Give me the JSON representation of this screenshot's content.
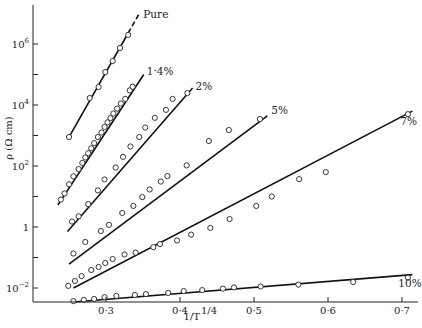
{
  "chart_data": {
    "type": "scatter",
    "title": "",
    "xlabel": "1/T^1/4",
    "xlabel_main": "1/T",
    "xlabel_exp": "1/4",
    "ylabel": "ρ (Ω cm)",
    "yscale": "log",
    "xlim": [
      0.235,
      0.715
    ],
    "ylim_log10": [
      -2.5,
      7.3
    ],
    "grid": false,
    "legend": "inline labels at line ends",
    "x_ticks": [
      {
        "value": 0.3,
        "label": "0·3"
      },
      {
        "value": 0.4,
        "label": "0·4"
      },
      {
        "value": 0.5,
        "label": "0·5"
      },
      {
        "value": 0.6,
        "label": "0·6"
      },
      {
        "value": 0.7,
        "label": "0·7"
      }
    ],
    "y_ticks": [
      {
        "log10": 6,
        "base": "10",
        "exp": "6"
      },
      {
        "log10": 4,
        "base": "10",
        "exp": "4"
      },
      {
        "log10": 2,
        "base": "10",
        "exp": "2"
      },
      {
        "log10": 0,
        "base": "1",
        "exp": ""
      },
      {
        "log10": -2,
        "base": "10",
        "exp": "−2"
      }
    ],
    "y_minor_ticks_log10": [
      5,
      3,
      1,
      -1
    ],
    "series": [
      {
        "name": "Pure",
        "label": "Pure",
        "fit": {
          "x0": 0.25,
          "y0": 2.95,
          "x1": 0.345,
          "y1": 7.0,
          "dashed_from_x": 0.33
        },
        "points": [
          [
            0.25,
            2.95
          ],
          [
            0.278,
            4.23
          ],
          [
            0.29,
            4.59
          ],
          [
            0.299,
            5.08
          ],
          [
            0.309,
            5.44
          ],
          [
            0.319,
            5.87
          ],
          [
            0.33,
            6.3
          ]
        ]
      },
      {
        "name": "1·4%",
        "label": "1·4%",
        "fit": {
          "x0": 0.235,
          "y0": 0.72,
          "x1": 0.351,
          "y1": 5.0
        },
        "points": [
          [
            0.239,
            0.9
          ],
          [
            0.244,
            1.1
          ],
          [
            0.25,
            1.4
          ],
          [
            0.256,
            1.66
          ],
          [
            0.263,
            1.9
          ],
          [
            0.268,
            2.1
          ],
          [
            0.272,
            2.28
          ],
          [
            0.276,
            2.42
          ],
          [
            0.28,
            2.58
          ],
          [
            0.284,
            2.75
          ],
          [
            0.289,
            2.95
          ],
          [
            0.294,
            3.1
          ],
          [
            0.298,
            3.28
          ],
          [
            0.302,
            3.43
          ],
          [
            0.306,
            3.57
          ],
          [
            0.31,
            3.72
          ],
          [
            0.315,
            3.88
          ],
          [
            0.32,
            4.05
          ],
          [
            0.326,
            4.2
          ],
          [
            0.332,
            4.48
          ],
          [
            0.336,
            4.6
          ]
        ]
      },
      {
        "name": "2%",
        "label": "2%",
        "fit": {
          "x0": 0.248,
          "y0": -0.15,
          "x1": 0.417,
          "y1": 4.56
        },
        "points": [
          [
            0.254,
            0.18
          ],
          [
            0.263,
            0.35
          ],
          [
            0.276,
            0.75
          ],
          [
            0.289,
            1.2
          ],
          [
            0.298,
            1.56
          ],
          [
            0.313,
            1.95
          ],
          [
            0.323,
            2.3
          ],
          [
            0.333,
            2.64
          ],
          [
            0.345,
            2.95
          ],
          [
            0.353,
            3.26
          ],
          [
            0.366,
            3.58
          ],
          [
            0.381,
            3.84
          ],
          [
            0.39,
            4.2
          ],
          [
            0.41,
            4.39
          ]
        ]
      },
      {
        "name": "5%",
        "label": "5%",
        "fit": {
          "x0": 0.25,
          "y0": -1.22,
          "x1": 0.518,
          "y1": 3.64
        },
        "points": [
          [
            0.256,
            -0.87
          ],
          [
            0.272,
            -0.49
          ],
          [
            0.293,
            -0.13
          ],
          [
            0.304,
            0.07
          ],
          [
            0.322,
            0.46
          ],
          [
            0.337,
            0.69
          ],
          [
            0.349,
            0.98
          ],
          [
            0.359,
            1.23
          ],
          [
            0.374,
            1.49
          ],
          [
            0.383,
            1.67
          ],
          [
            0.409,
            2.02
          ],
          [
            0.439,
            2.82
          ],
          [
            0.466,
            3.18
          ],
          [
            0.508,
            3.54
          ]
        ]
      },
      {
        "name": "7%",
        "label": "7%",
        "fit": {
          "x0": 0.256,
          "y0": -2.0,
          "x1": 0.714,
          "y1": 3.8
        },
        "points": [
          [
            0.249,
            -1.93
          ],
          [
            0.258,
            -1.77
          ],
          [
            0.267,
            -1.61
          ],
          [
            0.28,
            -1.41
          ],
          [
            0.29,
            -1.31
          ],
          [
            0.299,
            -1.18
          ],
          [
            0.309,
            -1.05
          ],
          [
            0.325,
            -0.9
          ],
          [
            0.34,
            -0.84
          ],
          [
            0.364,
            -0.66
          ],
          [
            0.373,
            -0.56
          ],
          [
            0.396,
            -0.44
          ],
          [
            0.415,
            -0.25
          ],
          [
            0.441,
            -0.03
          ],
          [
            0.467,
            0.26
          ],
          [
            0.503,
            0.69
          ],
          [
            0.524,
            1.0
          ],
          [
            0.561,
            1.57
          ],
          [
            0.597,
            1.8
          ],
          [
            0.708,
            3.7
          ]
        ]
      },
      {
        "name": "10%",
        "label": "10%",
        "fit": {
          "x0": 0.256,
          "y0": -2.46,
          "x1": 0.714,
          "y1": -1.56
        },
        "points": [
          [
            0.256,
            -2.43
          ],
          [
            0.27,
            -2.39
          ],
          [
            0.284,
            -2.36
          ],
          [
            0.298,
            -2.3
          ],
          [
            0.314,
            -2.26
          ],
          [
            0.339,
            -2.23
          ],
          [
            0.354,
            -2.2
          ],
          [
            0.384,
            -2.16
          ],
          [
            0.405,
            -2.1
          ],
          [
            0.43,
            -2.07
          ],
          [
            0.458,
            -2.02
          ],
          [
            0.473,
            -1.98
          ],
          [
            0.509,
            -1.95
          ],
          [
            0.56,
            -1.89
          ],
          [
            0.634,
            -1.8
          ],
          [
            0.708,
            -1.66
          ]
        ]
      }
    ],
    "series_label_offsets": {
      "Pure": [
        4,
        4
      ],
      "1·4%": [
        3,
        0
      ],
      "2%": [
        3,
        2
      ],
      "5%": [
        4,
        -2
      ],
      "7%": [
        -12,
        14
      ],
      "10%": [
        -14,
        12
      ]
    }
  }
}
